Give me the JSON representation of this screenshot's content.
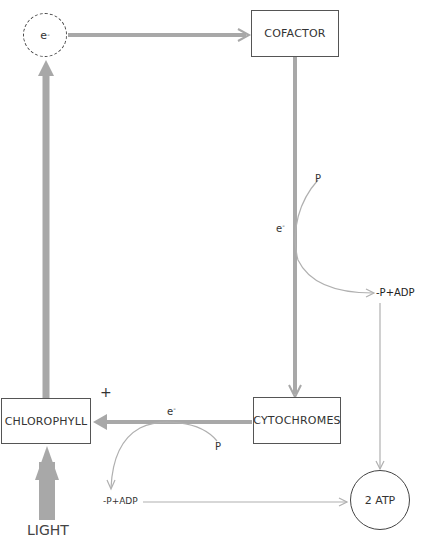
{
  "nodes": {
    "electron": {
      "label": "e",
      "sup": "-"
    },
    "cofactor": {
      "label": "COFACTOR"
    },
    "chlorophyll": {
      "label": "CHLOROPHYLL"
    },
    "cytochromes": {
      "label": "CYTOCHROMES"
    },
    "atp": {
      "label": "2 ATP"
    }
  },
  "labels": {
    "plus": "+",
    "light": "LIGHT",
    "e_right": "e",
    "e_bottom": "e",
    "sup": "-",
    "p_right": "P",
    "p_bottom": "P",
    "padp_right": "-P+ADP",
    "padp_bottom": "-P+ADP"
  },
  "colors": {
    "thick_arrow": "#a8a8a8",
    "thin_arrow": "#b0b0b0",
    "box_border": "#555555"
  }
}
